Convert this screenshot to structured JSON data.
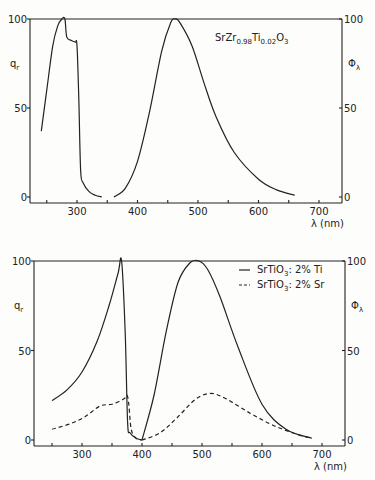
{
  "chart_data": [
    {
      "type": "line",
      "title": "SrZr0.98Ti0.02O3",
      "annotation": {
        "main": "SrZr",
        "sub1": "0.98",
        "mid": "Ti",
        "sub2": "0.02",
        "end": "O",
        "sub3": "3"
      },
      "xlabel": "λ (nm)",
      "ylabel_left": "q_r",
      "ylabel_right": "Φ_λ",
      "xlim": [
        225,
        740
      ],
      "ylim": [
        0,
        100
      ],
      "xticks": [
        300,
        400,
        500,
        600,
        700
      ],
      "yticks": [
        0,
        50,
        100
      ],
      "grid": false,
      "series": [
        {
          "name": "q_r (excitation)",
          "style": "solid",
          "x": [
            241,
            250,
            260,
            268,
            275,
            280,
            283,
            290,
            297,
            300,
            303,
            306,
            310,
            320,
            330,
            341
          ],
          "y": [
            37,
            60,
            85,
            96,
            100,
            100,
            90,
            88,
            87,
            85,
            55,
            15,
            8,
            3,
            1,
            0
          ]
        },
        {
          "name": "Φ_λ (emission)",
          "style": "solid",
          "x": [
            361,
            380,
            400,
            420,
            440,
            455,
            462,
            470,
            490,
            510,
            530,
            560,
            600,
            630,
            660
          ],
          "y": [
            0,
            5,
            20,
            48,
            82,
            98,
            100,
            98,
            85,
            64,
            45,
            25,
            10,
            4,
            1
          ]
        }
      ]
    },
    {
      "type": "line",
      "xlabel": "λ (nm)",
      "ylabel_left": "q_r",
      "ylabel_right": "Φ_λ",
      "xlim": [
        225,
        740
      ],
      "ylim": [
        0,
        100
      ],
      "xticks": [
        300,
        400,
        500,
        600,
        700
      ],
      "yticks": [
        0,
        50,
        100
      ],
      "grid": false,
      "legend": {
        "position": "upper right",
        "entries": [
          {
            "label": "SrTiO3: 2% Ti",
            "text": "SrTiO",
            "sub": "3",
            "rest": ": 2% Ti",
            "style": "solid"
          },
          {
            "label": "SrTiO3: 2% Sr",
            "text": "SrTiO",
            "sub": "3",
            "rest": ": 2% Sr",
            "style": "dashed"
          }
        ]
      },
      "series": [
        {
          "name": "SrTiO3: 2% Ti (q_r)",
          "style": "solid",
          "x": [
            250,
            275,
            300,
            325,
            345,
            360,
            366,
            372,
            376,
            380,
            390,
            400
          ],
          "y": [
            22,
            28,
            38,
            55,
            75,
            93,
            100,
            60,
            10,
            4,
            1,
            0
          ]
        },
        {
          "name": "SrTiO3: 2% Ti (Φ_λ)",
          "style": "solid",
          "x": [
            400,
            420,
            440,
            460,
            480,
            495,
            510,
            530,
            560,
            600,
            640,
            683
          ],
          "y": [
            0,
            25,
            60,
            88,
            99,
            100,
            95,
            80,
            52,
            20,
            6,
            1
          ]
        },
        {
          "name": "SrTiO3: 2% Sr (q_r)",
          "style": "dashed",
          "x": [
            250,
            280,
            305,
            330,
            350,
            370,
            375,
            378,
            382,
            390,
            400
          ],
          "y": [
            6,
            9,
            13,
            19,
            20,
            23,
            25,
            20,
            6,
            1,
            0
          ]
        },
        {
          "name": "SrTiO3: 2% Sr (Φ_λ)",
          "style": "dashed",
          "x": [
            400,
            430,
            460,
            490,
            515,
            540,
            580,
            620,
            660,
            683
          ],
          "y": [
            0,
            4,
            13,
            23,
            26,
            23,
            15,
            8,
            3,
            1
          ]
        }
      ]
    }
  ]
}
